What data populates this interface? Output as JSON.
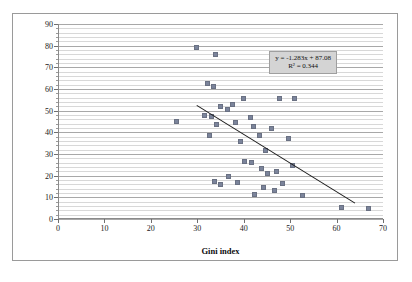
{
  "chart_data": {
    "type": "scatter",
    "title": "",
    "xlabel": "Gini index",
    "ylabel": "Unreimbursed healthcare expenses",
    "xlim": [
      0,
      70
    ],
    "ylim": [
      0,
      90
    ],
    "x_ticks": [
      0,
      10,
      20,
      30,
      40,
      50,
      60,
      70
    ],
    "y_ticks": [
      0,
      10,
      20,
      30,
      40,
      50,
      60,
      70,
      80,
      90
    ],
    "x_tick_labels": [
      "0",
      "10",
      "20",
      "30",
      "40",
      "50",
      "60",
      "70"
    ],
    "y_tick_labels": [
      "0",
      "10",
      "20",
      "30",
      "40",
      "50",
      "60",
      "70",
      "80",
      "90"
    ],
    "grid": true,
    "grid_axis": "y",
    "grid_minor_step": 2,
    "grid_major_step": 10,
    "legend": false,
    "marker_color": "#7b849b",
    "trendline_color": "#1c1c1c",
    "annotation": {
      "equation": "y = -1.283x + 87.08",
      "r_squared": "R² = 0.344",
      "slope": -1.283,
      "intercept": 87.08,
      "r2": 0.344
    },
    "trendline": {
      "x_start": 30.0,
      "y_start": 52.5,
      "x_end": 64.0,
      "y_end": 7.5
    },
    "points": [
      {
        "x": 25.6,
        "y": 45.0
      },
      {
        "x": 29.8,
        "y": 79.0
      },
      {
        "x": 32.2,
        "y": 62.5
      },
      {
        "x": 33.4,
        "y": 61.0
      },
      {
        "x": 34.0,
        "y": 76.0
      },
      {
        "x": 31.6,
        "y": 48.0
      },
      {
        "x": 33.0,
        "y": 47.5
      },
      {
        "x": 34.2,
        "y": 43.5
      },
      {
        "x": 32.6,
        "y": 38.5
      },
      {
        "x": 35.0,
        "y": 52.0
      },
      {
        "x": 36.4,
        "y": 50.5
      },
      {
        "x": 37.6,
        "y": 53.0
      },
      {
        "x": 38.2,
        "y": 44.5
      },
      {
        "x": 40.0,
        "y": 55.5
      },
      {
        "x": 41.4,
        "y": 47.0
      },
      {
        "x": 42.0,
        "y": 42.5
      },
      {
        "x": 39.2,
        "y": 36.0
      },
      {
        "x": 43.4,
        "y": 38.5
      },
      {
        "x": 44.6,
        "y": 31.5
      },
      {
        "x": 46.0,
        "y": 42.0
      },
      {
        "x": 47.8,
        "y": 55.5
      },
      {
        "x": 51.0,
        "y": 55.5
      },
      {
        "x": 49.6,
        "y": 37.0
      },
      {
        "x": 50.4,
        "y": 24.5
      },
      {
        "x": 33.8,
        "y": 17.5
      },
      {
        "x": 35.0,
        "y": 16.0
      },
      {
        "x": 36.8,
        "y": 19.5
      },
      {
        "x": 38.6,
        "y": 17.0
      },
      {
        "x": 40.2,
        "y": 26.5
      },
      {
        "x": 41.6,
        "y": 26.0
      },
      {
        "x": 42.4,
        "y": 11.5
      },
      {
        "x": 43.8,
        "y": 23.5
      },
      {
        "x": 44.2,
        "y": 14.5
      },
      {
        "x": 45.2,
        "y": 21.0
      },
      {
        "x": 46.6,
        "y": 13.0
      },
      {
        "x": 47.0,
        "y": 22.0
      },
      {
        "x": 48.4,
        "y": 16.5
      },
      {
        "x": 52.6,
        "y": 11.0
      },
      {
        "x": 61.0,
        "y": 5.5
      },
      {
        "x": 66.8,
        "y": 5.0
      }
    ]
  }
}
